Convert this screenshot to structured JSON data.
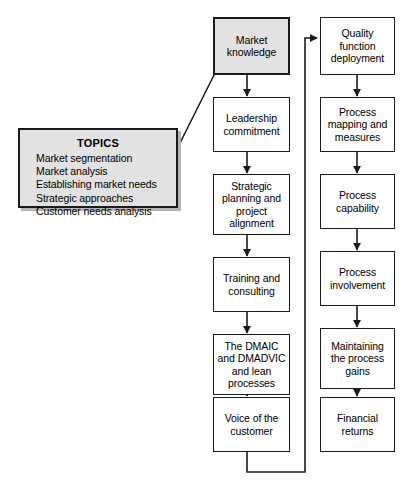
{
  "diagram": {
    "title_block": {
      "name": "topics-box",
      "heading": "TOPICS",
      "items": [
        "Market segmentation",
        "Market analysis",
        "Establishing market needs",
        "Strategic approaches",
        "Customer needs analysis"
      ]
    },
    "middle_column": [
      {
        "id": "market-knowledge",
        "label": "Market\nknowledge",
        "highlighted": true
      },
      {
        "id": "leadership-commitment",
        "label": "Leadership\ncommitment",
        "highlighted": false
      },
      {
        "id": "strategic-planning",
        "label": "Strategic\nplanning and\nproject\nalignment",
        "highlighted": false
      },
      {
        "id": "training-consulting",
        "label": "Training and\nconsulting",
        "highlighted": false
      },
      {
        "id": "dmaic-dmadvic",
        "label": "The DMAIC\nand DMADVIC\nand lean\nprocesses",
        "highlighted": false
      },
      {
        "id": "voice-of-customer",
        "label": "Voice of the\ncustomer",
        "highlighted": false
      }
    ],
    "right_column": [
      {
        "id": "quality-function-deployment",
        "label": "Quality\nfunction\ndeployment"
      },
      {
        "id": "process-mapping",
        "label": "Process\nmapping and\nmeasures"
      },
      {
        "id": "process-capability",
        "label": "Process\ncapability"
      },
      {
        "id": "process-involvement",
        "label": "Process\ninvolvement"
      },
      {
        "id": "maintaining-gains",
        "label": "Maintaining\nthe process\ngains"
      },
      {
        "id": "financial-returns",
        "label": "Financial\nreturns"
      }
    ],
    "colors": {
      "stroke": "#1b1b1b",
      "accent_fill": "#e2e2e2",
      "node_fill": "#ffffff",
      "shadow": "#b4b4b4"
    }
  }
}
